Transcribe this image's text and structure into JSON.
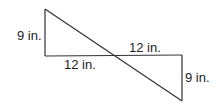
{
  "diagram": {
    "labels": {
      "left_vertical": "9 in.",
      "left_horizontal": "12 in.",
      "right_horizontal": "12 in.",
      "right_vertical": "9 in."
    },
    "colors": {
      "stroke": "#333333",
      "text": "#222222",
      "background": "#ffffff"
    }
  }
}
